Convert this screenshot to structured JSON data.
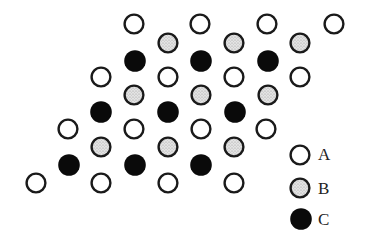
{
  "diagram": {
    "circle_radius": 10,
    "styles": {
      "A": {
        "fill": "#ffffff",
        "stroke": "#1a1a1a",
        "pattern": "hollow"
      },
      "B": {
        "fill": "#d9d9d9",
        "stroke": "#1a1a1a",
        "pattern": "stippled-gray"
      },
      "C": {
        "fill": "#0a0a0a",
        "stroke": "#0a0a0a",
        "pattern": "solid-black"
      }
    },
    "rows": [
      {
        "type": "A",
        "y": 24,
        "x": [
          134,
          200,
          267,
          334
        ]
      },
      {
        "type": "B",
        "y": 43,
        "x": [
          168,
          234,
          300
        ]
      },
      {
        "type": "C",
        "y": 61,
        "x": [
          135,
          201,
          268
        ]
      },
      {
        "type": "A",
        "y": 77,
        "x": [
          101,
          168,
          234,
          300
        ]
      },
      {
        "type": "B",
        "y": 95,
        "x": [
          134,
          201,
          268
        ]
      },
      {
        "type": "C",
        "y": 112,
        "x": [
          101,
          168,
          235
        ]
      },
      {
        "type": "A",
        "y": 129,
        "x": [
          68,
          134,
          201,
          266
        ]
      },
      {
        "type": "B",
        "y": 147,
        "x": [
          101,
          168,
          234
        ]
      },
      {
        "type": "C",
        "y": 165,
        "x": [
          69,
          135,
          201
        ]
      },
      {
        "type": "A",
        "y": 183,
        "x": [
          36,
          101,
          168,
          234
        ]
      }
    ]
  },
  "legend": {
    "items": [
      {
        "type": "A",
        "label": "A",
        "cx": 300,
        "cy": 155
      },
      {
        "type": "B",
        "label": "B",
        "cx": 300,
        "cy": 188
      },
      {
        "type": "C",
        "label": "C",
        "cx": 301,
        "cy": 219
      }
    ]
  }
}
